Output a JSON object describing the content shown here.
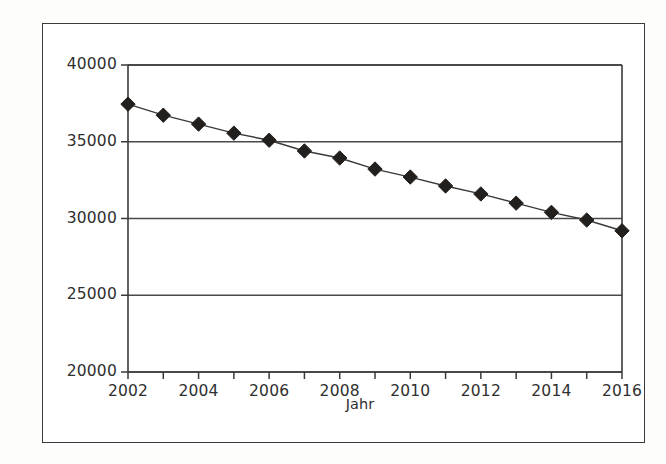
{
  "chart_data": {
    "type": "line",
    "title": "",
    "subtitle": "",
    "xlabel": "Jahr",
    "ylabel": "",
    "x": [
      2002,
      2003,
      2004,
      2005,
      2006,
      2007,
      2008,
      2009,
      2010,
      2011,
      2012,
      2013,
      2014,
      2015,
      2016
    ],
    "values": [
      37450,
      36730,
      36150,
      35560,
      35100,
      34400,
      33940,
      33220,
      32700,
      32120,
      31600,
      31000,
      30400,
      29900,
      29200
    ],
    "series": [
      {
        "name": "",
        "marker": "diamond",
        "marker_color": "#231f1c",
        "line_color": "#3a3a3a",
        "values": [
          37450,
          36730,
          36150,
          35560,
          35100,
          34400,
          33940,
          33220,
          32700,
          32120,
          31600,
          31000,
          30400,
          29900,
          29200
        ]
      }
    ],
    "xlim": [
      2002,
      2016
    ],
    "ylim": [
      20000,
      40000
    ],
    "ytick_labels": [
      "20000",
      "25000",
      "30000",
      "35000",
      "40000"
    ],
    "ytick_values": [
      20000,
      25000,
      30000,
      35000,
      40000
    ],
    "xtick_labels": [
      "2002",
      "2004",
      "2006",
      "2008",
      "2010",
      "2012",
      "2014",
      "2016"
    ],
    "xtick_values": [
      2002,
      2004,
      2006,
      2008,
      2010,
      2012,
      2014,
      2016
    ],
    "xtick_minor_values": [
      2003,
      2005,
      2007,
      2009,
      2011,
      2013,
      2015
    ],
    "grid": {
      "horizontal": true,
      "vertical": false,
      "color": "#4a4a4a"
    },
    "legend": {
      "visible": false,
      "position": "none",
      "entries": []
    },
    "axis_color": "#3a3a3a",
    "plot_background": "#ffffff",
    "frame_color": "#3a3a3a"
  }
}
